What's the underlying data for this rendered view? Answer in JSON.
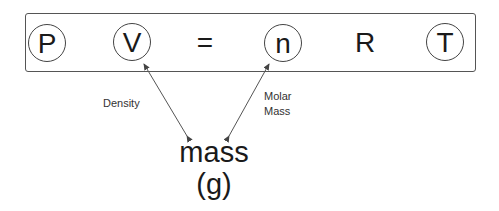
{
  "equation": {
    "symbols": [
      {
        "text": "P",
        "circled": true
      },
      {
        "text": "V",
        "circled": true
      },
      {
        "text": "=",
        "circled": false
      },
      {
        "text": "n",
        "circled": true
      },
      {
        "text": "R",
        "circled": false
      },
      {
        "text": "T",
        "circled": true
      }
    ]
  },
  "annotations": {
    "density_label": "Density",
    "molar_mass_label_line1": "Molar",
    "molar_mass_label_line2": "Mass"
  },
  "target": {
    "quantity": "mass",
    "unit": "(g)"
  },
  "colors": {
    "line": "#555555",
    "text": "#1a1a1a"
  }
}
